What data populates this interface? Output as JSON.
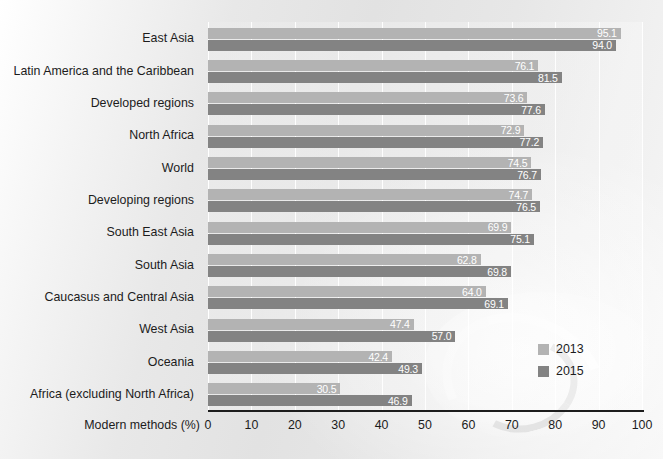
{
  "chart_data": {
    "type": "bar",
    "orientation": "horizontal",
    "title": "",
    "xlabel": "Modern methods (%)",
    "ylabel": "",
    "xlim": [
      0,
      100
    ],
    "xticks": [
      0,
      10,
      20,
      30,
      40,
      50,
      60,
      70,
      80,
      90,
      100
    ],
    "grid": true,
    "grid_axis": "x",
    "legend_position": "bottom-right",
    "categories": [
      "East Asia",
      "Latin America and the Caribbean",
      "Developed regions",
      "North Africa",
      "World",
      "Developing regions",
      "South East Asia",
      "South Asia",
      "Caucasus and Central Asia",
      "West Asia",
      "Oceania",
      "Africa (excluding North Africa)"
    ],
    "series": [
      {
        "name": "2013",
        "color": "#b3b3b3",
        "values": [
          95.1,
          76.1,
          73.6,
          72.9,
          74.5,
          74.7,
          69.9,
          62.8,
          64.0,
          47.4,
          42.4,
          30.5
        ],
        "value_labels": [
          "95.1",
          "76.1",
          "73.6",
          "72.9",
          "74.5",
          "74.7",
          "69.9",
          "62.8",
          "64.0",
          "47.4",
          "42.4",
          "30.5"
        ]
      },
      {
        "name": "2015",
        "color": "#838383",
        "values": [
          94.0,
          81.5,
          77.6,
          77.2,
          76.7,
          76.5,
          75.1,
          69.8,
          69.1,
          57.0,
          49.3,
          46.9
        ],
        "value_labels": [
          "94.0",
          "81.5",
          "77.6",
          "77.2",
          "76.7",
          "76.5",
          "75.1",
          "69.8",
          "69.1",
          "57.0",
          "49.3",
          "46.9"
        ]
      }
    ]
  },
  "legend": {
    "entries": [
      {
        "label": "2013",
        "color": "#b3b3b3"
      },
      {
        "label": "2015",
        "color": "#838383"
      }
    ]
  },
  "axis": {
    "x_title": "Modern methods (%)",
    "tick_labels": [
      "0",
      "10",
      "20",
      "30",
      "40",
      "50",
      "60",
      "70",
      "80",
      "90",
      "100"
    ]
  },
  "header": {
    "cropped_title": ""
  },
  "colors": {
    "series_2013": "#b3b3b3",
    "series_2015": "#838383",
    "axis_line": "#1d1d1d",
    "gridline": "#ffffff",
    "text": "#1c1c1c",
    "value_label_text": "#ffffff"
  }
}
